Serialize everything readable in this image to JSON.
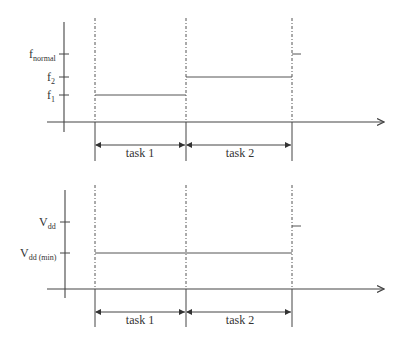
{
  "diagram": {
    "top_panel": {
      "y_axis_labels": [
        {
          "main": "f",
          "sub": "normal",
          "y": 54
        },
        {
          "main": "f",
          "sub": "2",
          "y": 77
        },
        {
          "main": "f",
          "sub": "1",
          "y": 95
        }
      ],
      "task_labels": [
        "task 1",
        "task 2"
      ]
    },
    "bottom_panel": {
      "y_axis_labels": [
        {
          "main": "V",
          "sub": "dd",
          "y": 222
        },
        {
          "main": "V",
          "sub": "dd (min)",
          "y": 253
        }
      ],
      "task_labels": [
        "task 1",
        "task 2"
      ]
    },
    "colors": {
      "line": "#444444",
      "dashed": "#555555",
      "text": "#333333"
    }
  }
}
